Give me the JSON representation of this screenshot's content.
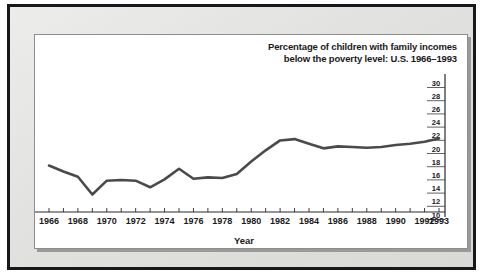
{
  "chart_data": {
    "type": "line",
    "title": "Percentage of children with family incomes below the poverty level: U.S. 1966–1993",
    "title_lines": [
      "Percentage of children with family incomes",
      "below the poverty level: U.S. 1966–1993"
    ],
    "xlabel": "Year",
    "ylabel": "",
    "xlim": [
      1966,
      1993
    ],
    "ylim": [
      10,
      30
    ],
    "grid": false,
    "legend": null,
    "y_axis_position": "right",
    "x_tick_labels": [
      "1966",
      "1968",
      "1970",
      "1972",
      "1974",
      "1976",
      "1978",
      "1980",
      "1982",
      "1984",
      "1986",
      "1988",
      "1990",
      "1992",
      "1993"
    ],
    "y_tick_labels": [
      "30",
      "28",
      "26",
      "24",
      "22",
      "20",
      "18",
      "16",
      "14",
      "12",
      "10"
    ],
    "y_ticks": [
      30,
      28,
      26,
      24,
      22,
      20,
      18,
      16,
      14,
      12,
      10
    ],
    "x": [
      1966,
      1967,
      1968,
      1969,
      1970,
      1971,
      1972,
      1973,
      1974,
      1975,
      1976,
      1977,
      1978,
      1979,
      1980,
      1981,
      1982,
      1983,
      1984,
      1985,
      1986,
      1987,
      1988,
      1989,
      1990,
      1991,
      1992,
      1993
    ],
    "values": [
      17.5,
      16.6,
      15.8,
      13.1,
      15.2,
      15.3,
      15.2,
      14.2,
      15.4,
      17.0,
      15.5,
      15.7,
      15.6,
      16.2,
      18.1,
      19.8,
      21.3,
      21.5,
      20.8,
      20.1,
      20.4,
      20.3,
      20.2,
      20.3,
      20.6,
      20.8,
      21.1,
      21.6
    ],
    "series": [
      {
        "name": "Percentage of children below poverty level",
        "values": [
          17.5,
          16.6,
          15.8,
          13.1,
          15.2,
          15.3,
          15.2,
          14.2,
          15.4,
          17.0,
          15.5,
          15.7,
          15.6,
          16.2,
          18.1,
          19.8,
          21.3,
          21.5,
          20.8,
          20.1,
          20.4,
          20.3,
          20.2,
          20.3,
          20.6,
          20.8,
          21.1,
          21.6
        ],
        "color": "#4a4a4c"
      }
    ],
    "colors": {
      "line": "#4a4a4c",
      "axis": "#2a2a2c",
      "panel_background": "#ffffff",
      "mat_background": "#e3e3e1",
      "frame": "#17181a",
      "text": "#1a1a1c"
    }
  }
}
